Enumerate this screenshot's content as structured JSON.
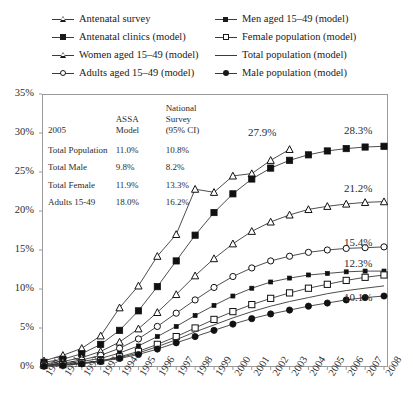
{
  "legend": {
    "items": [
      {
        "label": "Antenatal survey",
        "marker": "tr-o",
        "col": 0
      },
      {
        "label": "Antenatal clinics (model)",
        "marker": "sq-f",
        "col": 0
      },
      {
        "label": "Women aged 15–49 (model)",
        "marker": "tr-o",
        "col": 0
      },
      {
        "label": "Adults aged 15–49 (model)",
        "marker": "ci-o",
        "col": 0
      },
      {
        "label": "Men aged 15–49 (model)",
        "marker": "sq-s",
        "col": 1
      },
      {
        "label": "Female population (model)",
        "marker": "sq-o",
        "col": 1
      },
      {
        "label": "Total population (model)",
        "marker": "none",
        "col": 1
      },
      {
        "label": "Male population (model)",
        "marker": "ci-f",
        "col": 1
      }
    ]
  },
  "table": {
    "year_label": "2005",
    "col2_header": [
      "ASSA",
      "Model"
    ],
    "col3_header": [
      "National",
      "Survey",
      "(95% CI)"
    ],
    "rows": [
      {
        "name": "Total Population",
        "assa": "11.0%",
        "survey": "10.8%"
      },
      {
        "name": "Total Male",
        "assa": "9.8%",
        "survey": "8.2%"
      },
      {
        "name": "Total Female",
        "assa": "11.9%",
        "survey": "13.3%"
      },
      {
        "name": "Adults 15-49",
        "assa": "18.0%",
        "survey": "16.2%"
      }
    ]
  },
  "end_labels": [
    {
      "text": "27.9%",
      "x": 248,
      "y": 126
    },
    {
      "text": "28.3%",
      "x": 344,
      "y": 124
    },
    {
      "text": "21.2%",
      "x": 344,
      "y": 182
    },
    {
      "text": "15.4%",
      "x": 344,
      "y": 236
    },
    {
      "text": "12.3%",
      "x": 344,
      "y": 257
    },
    {
      "text": "10.1%",
      "x": 344,
      "y": 291
    }
  ],
  "chart_data": {
    "type": "line",
    "title": "",
    "xlabel": "",
    "ylabel": "",
    "ylim": [
      0,
      35
    ],
    "ytick_labels": [
      "0%",
      "5%",
      "10%",
      "15%",
      "20%",
      "25%",
      "30%",
      "35%"
    ],
    "ytick_values": [
      0,
      5,
      10,
      15,
      20,
      25,
      30,
      35
    ],
    "grid": false,
    "legend_position": "top",
    "categories": [
      1990,
      1991,
      1992,
      1993,
      1994,
      1995,
      1996,
      1997,
      1998,
      1999,
      2000,
      2001,
      2002,
      2003,
      2004,
      2005,
      2006,
      2007,
      2008
    ],
    "x": [
      1990,
      1991,
      1992,
      1993,
      1994,
      1995,
      1996,
      1997,
      1998,
      1999,
      2000,
      2001,
      2002,
      2003,
      2004,
      2005,
      2006,
      2007,
      2008
    ],
    "series": [
      {
        "name": "Antenatal survey",
        "marker": "tr-o",
        "end_label": "27.9%",
        "x": [
          1990,
          1991,
          1992,
          1993,
          1994,
          1995,
          1996,
          1997,
          1998,
          1999,
          2000,
          2001,
          2002,
          2003
        ],
        "values": [
          0.8,
          1.5,
          2.4,
          4.0,
          7.6,
          10.4,
          14.2,
          17.0,
          22.8,
          22.4,
          24.5,
          24.8,
          26.5,
          27.9
        ]
      },
      {
        "name": "Antenatal clinics (model)",
        "marker": "sq-f",
        "end_label": "28.3%",
        "values": [
          0.6,
          1.0,
          1.7,
          2.9,
          4.7,
          7.2,
          10.3,
          13.6,
          16.9,
          19.8,
          22.2,
          24.1,
          25.5,
          26.5,
          27.2,
          27.7,
          28.0,
          28.2,
          28.3
        ]
      },
      {
        "name": "Women aged 15–49 (model)",
        "marker": "tr-o",
        "end_label": "21.2%",
        "values": [
          0.4,
          0.7,
          1.2,
          2.0,
          3.2,
          4.9,
          7.0,
          9.3,
          11.7,
          13.9,
          15.8,
          17.4,
          18.6,
          19.5,
          20.2,
          20.6,
          20.9,
          21.1,
          21.2
        ]
      },
      {
        "name": "Adults aged 15–49 (model)",
        "marker": "ci-o",
        "end_label": "15.4%",
        "values": [
          0.3,
          0.5,
          0.9,
          1.5,
          2.4,
          3.6,
          5.2,
          6.9,
          8.6,
          10.2,
          11.6,
          12.7,
          13.6,
          14.2,
          14.7,
          15.0,
          15.2,
          15.3,
          15.4
        ]
      },
      {
        "name": "Men aged 15–49 (model)",
        "marker": "sq-s",
        "end_label": "12.3%",
        "values": [
          0.2,
          0.4,
          0.7,
          1.1,
          1.8,
          2.7,
          3.9,
          5.2,
          6.6,
          7.9,
          9.1,
          10.1,
          10.9,
          11.4,
          11.8,
          12.0,
          12.2,
          12.3,
          12.3
        ]
      },
      {
        "name": "Female population (model)",
        "marker": "sq-o",
        "end_label": "",
        "values": [
          0.2,
          0.3,
          0.5,
          0.8,
          1.3,
          2.0,
          2.9,
          3.9,
          5.0,
          6.1,
          7.1,
          8.0,
          8.8,
          9.5,
          10.1,
          10.6,
          11.1,
          11.5,
          11.8
        ]
      },
      {
        "name": "Total population (model)",
        "marker": "none",
        "end_label": "",
        "values": [
          0.2,
          0.3,
          0.5,
          0.8,
          1.2,
          1.8,
          2.6,
          3.5,
          4.5,
          5.4,
          6.3,
          7.1,
          7.8,
          8.4,
          8.9,
          9.4,
          9.8,
          10.1,
          10.4
        ]
      },
      {
        "name": "Male population (model)",
        "marker": "ci-f",
        "end_label": "10.1%",
        "values": [
          0.1,
          0.2,
          0.4,
          0.7,
          1.1,
          1.6,
          2.3,
          3.1,
          3.9,
          4.7,
          5.5,
          6.2,
          6.8,
          7.3,
          7.8,
          8.2,
          8.6,
          8.9,
          9.1
        ]
      }
    ]
  }
}
